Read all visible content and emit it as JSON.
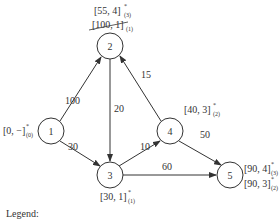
{
  "nodes": [
    {
      "id": "1",
      "label": "1",
      "x": 51,
      "y": 131,
      "tag_main": "[0, −]",
      "tag_sup": "*",
      "tag_sub": "(0)"
    },
    {
      "id": "2",
      "label": "2",
      "x": 110,
      "y": 46,
      "tag_main": "[55, 4]",
      "tag_sup": "*",
      "tag_sub": "(3)",
      "tag2_main": "[100, 1]",
      "tag2_sub": "(1)",
      "tag2_struck": true
    },
    {
      "id": "3",
      "label": "3",
      "x": 110,
      "y": 175,
      "tag_main": "[30, 1]",
      "tag_sup": "*",
      "tag_sub": "(1)"
    },
    {
      "id": "4",
      "label": "4",
      "x": 170,
      "y": 131,
      "tag_main": "[40, 3]",
      "tag_sup": "*",
      "tag_sub": "(2)"
    },
    {
      "id": "5",
      "label": "5",
      "x": 230,
      "y": 175,
      "tag_main": "[90, 4]",
      "tag_sup": "*",
      "tag_sub": "(3)",
      "tag2_main": "[90, 3]",
      "tag2_sup": "*",
      "tag2_sub": "(2)"
    }
  ],
  "edges": [
    {
      "from": "1",
      "to": "2",
      "weight": "100"
    },
    {
      "from": "1",
      "to": "3",
      "weight": "30"
    },
    {
      "from": "2",
      "to": "3",
      "weight": "20"
    },
    {
      "from": "3",
      "to": "4",
      "weight": "10"
    },
    {
      "from": "4",
      "to": "2",
      "weight": "15"
    },
    {
      "from": "4",
      "to": "5",
      "weight": "50"
    },
    {
      "from": "3",
      "to": "5",
      "weight": "60"
    }
  ],
  "legend": {
    "label": "Legend:"
  }
}
